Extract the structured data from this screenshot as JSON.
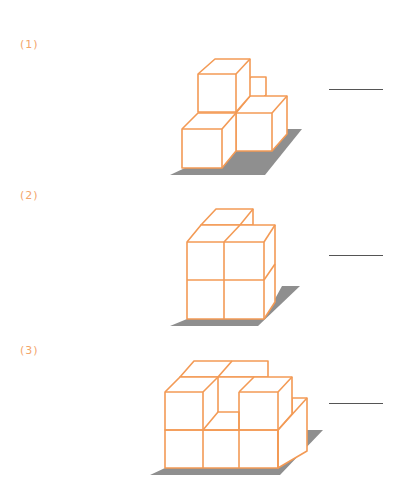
{
  "problems": [
    {
      "label": "(1)",
      "answer": "",
      "description": "Cube stack: 4 visible unit cubes in two layers on a gray base"
    },
    {
      "label": "(2)",
      "answer": "",
      "description": "Cube stack: 2x2 front face two layers high, top layer with back-right missing"
    },
    {
      "label": "(3)",
      "answer": "",
      "description": "Cube stack: 3-wide front, two layers with a center notch on top and a lower column at right"
    }
  ],
  "colors": {
    "cube_edge": "#f39a55",
    "label": "#f3a56b",
    "shadow": "#8f8f8f",
    "answer_line": "#555555"
  }
}
